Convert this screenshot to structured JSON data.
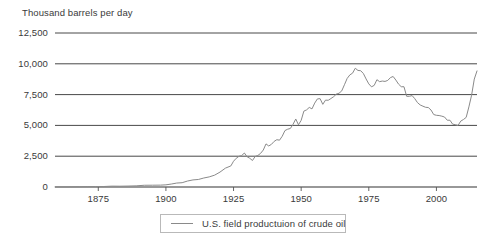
{
  "chart_data": {
    "type": "line",
    "title": "Thousand barrels per day",
    "xlabel": "",
    "ylabel": "Thousand barrels per day",
    "ylim": [
      0,
      12500
    ],
    "xlim": [
      1859,
      2015
    ],
    "grid": true,
    "legend_position": "bottom-center",
    "y_ticks": [
      "0",
      "2,500",
      "5,000",
      "7,500",
      "10,000",
      "12,500"
    ],
    "y_tick_values": [
      0,
      2500,
      5000,
      7500,
      10000,
      12500
    ],
    "x_ticks": [
      "1875",
      "1900",
      "1925",
      "1950",
      "1975",
      "2000"
    ],
    "x_tick_values": [
      1875,
      1900,
      1925,
      1950,
      1975,
      2000
    ],
    "series": [
      {
        "name": "U.S. field productuion of crude oil",
        "color": "#8a8a8a",
        "x": [
          1859,
          1862,
          1865,
          1868,
          1871,
          1874,
          1877,
          1880,
          1883,
          1886,
          1889,
          1892,
          1895,
          1898,
          1900,
          1902,
          1904,
          1906,
          1908,
          1910,
          1912,
          1914,
          1916,
          1918,
          1920,
          1922,
          1924,
          1925,
          1926,
          1927,
          1928,
          1929,
          1930,
          1931,
          1932,
          1933,
          1934,
          1935,
          1936,
          1937,
          1938,
          1939,
          1940,
          1941,
          1942,
          1943,
          1944,
          1945,
          1946,
          1947,
          1948,
          1949,
          1950,
          1951,
          1952,
          1953,
          1954,
          1955,
          1956,
          1957,
          1958,
          1959,
          1960,
          1961,
          1962,
          1963,
          1964,
          1965,
          1966,
          1967,
          1968,
          1969,
          1970,
          1971,
          1972,
          1973,
          1974,
          1975,
          1976,
          1977,
          1978,
          1979,
          1980,
          1981,
          1982,
          1983,
          1984,
          1985,
          1986,
          1987,
          1988,
          1989,
          1990,
          1991,
          1992,
          1993,
          1994,
          1995,
          1996,
          1997,
          1998,
          1999,
          2000,
          2001,
          2002,
          2003,
          2004,
          2005,
          2006,
          2007,
          2008,
          2009,
          2010,
          2011,
          2012,
          2013,
          2014,
          2015
        ],
        "values": [
          5,
          8,
          12,
          20,
          30,
          30,
          38,
          70,
          65,
          77,
          95,
          140,
          145,
          152,
          175,
          240,
          320,
          350,
          485,
          575,
          610,
          730,
          820,
          960,
          1210,
          1530,
          1710,
          2090,
          2330,
          2490,
          2550,
          2760,
          2460,
          2330,
          2150,
          2480,
          2560,
          2730,
          3000,
          3500,
          3330,
          3460,
          3700,
          3840,
          3800,
          4120,
          4580,
          4690,
          4750,
          5090,
          5520,
          5050,
          5410,
          6160,
          6260,
          6460,
          6340,
          6810,
          7150,
          7170,
          6710,
          7050,
          7040,
          7180,
          7330,
          7540,
          7610,
          7800,
          8300,
          8810,
          9100,
          9240,
          9640,
          9460,
          9440,
          9210,
          8770,
          8370,
          8130,
          8250,
          8710,
          8550,
          8600,
          8570,
          8650,
          8880,
          8970,
          8680,
          8350,
          8140,
          8140,
          7360,
          7360,
          7420,
          7170,
          6850,
          6660,
          6560,
          6470,
          6450,
          6250,
          5880,
          5820,
          5800,
          5750,
          5680,
          5420,
          5420,
          5100,
          5060,
          5000,
          5350,
          5480,
          5650,
          6500,
          7450,
          8760,
          9420
        ]
      }
    ]
  },
  "legend": {
    "entries": [
      {
        "label": "U.S. field productuion of crude oil",
        "swatch": "line-swatch"
      }
    ]
  }
}
